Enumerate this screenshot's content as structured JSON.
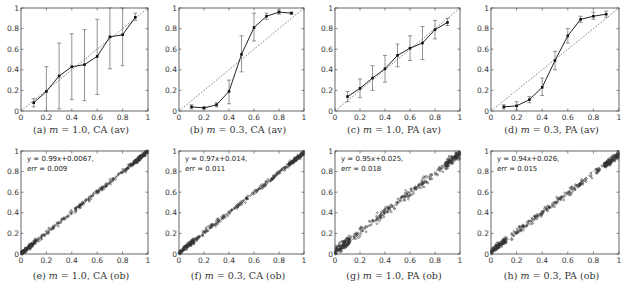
{
  "figure": {
    "panels_layout": "2 rows x 4 columns"
  },
  "chart_data": [
    {
      "id": "a",
      "type": "line",
      "caption": "(a) m = 1.0, CA (av)",
      "caption_prefix": "(a) ",
      "caption_var": "m",
      "caption_rest": " = 1.0, CA (av)",
      "xlim": [
        0,
        1
      ],
      "ylim": [
        0,
        1
      ],
      "xticks": [
        "0",
        "0.2",
        "0.4",
        "0.6",
        "0.8",
        "1"
      ],
      "yticks": [
        "0",
        "0.2",
        "0.4",
        "0.6",
        "0.8",
        "1"
      ],
      "diagonal": true,
      "x": [
        0.1,
        0.2,
        0.3,
        0.4,
        0.5,
        0.6,
        0.7,
        0.8,
        0.9
      ],
      "y": [
        0.08,
        0.19,
        0.34,
        0.43,
        0.45,
        0.53,
        0.72,
        0.74,
        0.91
      ],
      "err_low": [
        0.04,
        0.0,
        0.02,
        0.11,
        0.1,
        0.16,
        0.41,
        0.44,
        0.88
      ],
      "err_high": [
        0.12,
        0.43,
        0.66,
        0.75,
        0.79,
        0.89,
        1.0,
        1.0,
        0.95
      ]
    },
    {
      "id": "b",
      "type": "line",
      "caption": "(b) m = 0.3, CA (av)",
      "caption_prefix": "(b) ",
      "caption_var": "m",
      "caption_rest": " = 0.3, CA (av)",
      "xlim": [
        0,
        1
      ],
      "ylim": [
        0,
        1
      ],
      "xticks": [
        "0",
        "0.2",
        "0.4",
        "0.6",
        "0.8",
        "1"
      ],
      "yticks": [
        "0",
        "0.2",
        "0.4",
        "0.6",
        "0.8",
        "1"
      ],
      "diagonal": true,
      "x": [
        0.1,
        0.2,
        0.3,
        0.4,
        0.5,
        0.6,
        0.7,
        0.8,
        0.9
      ],
      "y": [
        0.04,
        0.03,
        0.06,
        0.19,
        0.55,
        0.81,
        0.92,
        0.96,
        0.95
      ],
      "err_low": [
        0.02,
        0.02,
        0.04,
        0.07,
        0.38,
        0.68,
        0.89,
        0.94,
        0.94
      ],
      "err_high": [
        0.06,
        0.04,
        0.08,
        0.3,
        0.73,
        0.95,
        0.95,
        0.98,
        0.96
      ]
    },
    {
      "id": "c",
      "type": "line",
      "caption": "(c) m = 1.0, PA (av)",
      "caption_prefix": "(c) ",
      "caption_var": "m",
      "caption_rest": " = 1.0, PA (av)",
      "xlim": [
        0,
        1
      ],
      "ylim": [
        0,
        1
      ],
      "xticks": [
        "0",
        "0.2",
        "0.4",
        "0.6",
        "0.8",
        "1"
      ],
      "yticks": [
        "0",
        "0.2",
        "0.4",
        "0.6",
        "0.8",
        "1"
      ],
      "diagonal": true,
      "x": [
        0.1,
        0.2,
        0.3,
        0.4,
        0.5,
        0.6,
        0.7,
        0.8,
        0.9
      ],
      "y": [
        0.14,
        0.22,
        0.32,
        0.41,
        0.54,
        0.61,
        0.66,
        0.79,
        0.86
      ],
      "err_low": [
        0.09,
        0.13,
        0.2,
        0.28,
        0.43,
        0.49,
        0.5,
        0.7,
        0.83
      ],
      "err_high": [
        0.19,
        0.31,
        0.44,
        0.54,
        0.65,
        0.73,
        0.82,
        0.88,
        0.9
      ]
    },
    {
      "id": "d",
      "type": "line",
      "caption": "(d) m = 0.3, PA (av)",
      "caption_prefix": "(d) ",
      "caption_var": "m",
      "caption_rest": " = 0.3, PA (av)",
      "xlim": [
        0,
        1
      ],
      "ylim": [
        0,
        1
      ],
      "xticks": [
        "0",
        "0.2",
        "0.4",
        "0.6",
        "0.8",
        "1"
      ],
      "yticks": [
        "0",
        "0.2",
        "0.4",
        "0.6",
        "0.8",
        "1"
      ],
      "diagonal": true,
      "x": [
        0.1,
        0.2,
        0.3,
        0.4,
        0.5,
        0.6,
        0.7,
        0.8,
        0.9
      ],
      "y": [
        0.04,
        0.05,
        0.11,
        0.23,
        0.49,
        0.73,
        0.89,
        0.92,
        0.94
      ],
      "err_low": [
        0.02,
        0.01,
        0.08,
        0.15,
        0.4,
        0.66,
        0.86,
        0.89,
        0.91
      ],
      "err_high": [
        0.06,
        0.09,
        0.14,
        0.32,
        0.58,
        0.8,
        0.92,
        0.96,
        0.97
      ]
    },
    {
      "id": "e",
      "type": "scatter",
      "caption": "(e) m = 1.0, CA (ob)",
      "caption_prefix": "(e) ",
      "caption_var": "m",
      "caption_rest": " = 1.0, CA (ob)",
      "xlim": [
        0,
        1
      ],
      "ylim": [
        0,
        1
      ],
      "xticks": [
        "0",
        "0.2",
        "0.4",
        "0.6",
        "0.8",
        "1"
      ],
      "yticks": [
        "0",
        "0.2",
        "0.4",
        "0.6",
        "0.8",
        "1"
      ],
      "diagonal": true,
      "annotation_line1": "y = 0.99x+0.0067,",
      "annotation_line2": "err = 0.009",
      "fit": {
        "slope": 0.99,
        "intercept": 0.0067,
        "err": 0.009
      },
      "spread": 0.012
    },
    {
      "id": "f",
      "type": "scatter",
      "caption": "(f) m = 0.3, CA (ob)",
      "caption_prefix": "(f) ",
      "caption_var": "m",
      "caption_rest": " = 0.3, CA (ob)",
      "xlim": [
        0,
        1
      ],
      "ylim": [
        0,
        1
      ],
      "xticks": [
        "0",
        "0.2",
        "0.4",
        "0.6",
        "0.8",
        "1"
      ],
      "yticks": [
        "0",
        "0.2",
        "0.4",
        "0.6",
        "0.8",
        "1"
      ],
      "diagonal": true,
      "annotation_line1": "y = 0.97x+0.014,",
      "annotation_line2": "err = 0.011",
      "fit": {
        "slope": 0.97,
        "intercept": 0.014,
        "err": 0.011
      },
      "spread": 0.012
    },
    {
      "id": "g",
      "type": "scatter",
      "caption": "(g) m = 1.0, PA (ob)",
      "caption_prefix": "(g) ",
      "caption_var": "m",
      "caption_rest": " = 1.0, PA (ob)",
      "xlim": [
        0,
        1
      ],
      "ylim": [
        0,
        1
      ],
      "xticks": [
        "0",
        "0.2",
        "0.4",
        "0.6",
        "0.8",
        "1"
      ],
      "yticks": [
        "0",
        "0.2",
        "0.4",
        "0.6",
        "0.8",
        "1"
      ],
      "diagonal": true,
      "annotation_line1": "y = 0.95x+0.025,",
      "annotation_line2": "err = 0.018",
      "fit": {
        "slope": 0.95,
        "intercept": 0.025,
        "err": 0.018
      },
      "spread": 0.022
    },
    {
      "id": "h",
      "type": "scatter",
      "caption": "(h) m = 0.3, PA (ob)",
      "caption_prefix": "(h) ",
      "caption_var": "m",
      "caption_rest": " = 0.3, PA (ob)",
      "xlim": [
        0,
        1
      ],
      "ylim": [
        0,
        1
      ],
      "xticks": [
        "0",
        "0.2",
        "0.4",
        "0.6",
        "0.8",
        "1"
      ],
      "yticks": [
        "0",
        "0.2",
        "0.4",
        "0.6",
        "0.8",
        "1"
      ],
      "diagonal": true,
      "annotation_line1": "y = 0.94x+0.026,",
      "annotation_line2": "err = 0.015",
      "fit": {
        "slope": 0.94,
        "intercept": 0.026,
        "err": 0.015
      },
      "spread": 0.016
    }
  ]
}
